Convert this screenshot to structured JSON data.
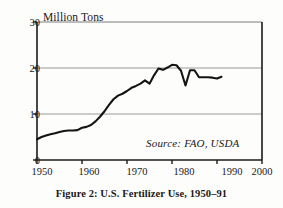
{
  "figure": {
    "caption": "Figure 2: U.S. Fertilizer Use, 1950–91",
    "source_note": "Source: FAO, USDA",
    "axis_title": "Million Tons",
    "line_color": "#141414",
    "grid_color": "#9a9a9a",
    "axis_color": "#1a1a1a",
    "background": "#fdfdfb"
  },
  "ticks": {
    "y": [
      "0",
      "10",
      "20",
      "30"
    ],
    "x": [
      "1950",
      "1960",
      "1970",
      "1980",
      "1990",
      "2000"
    ]
  },
  "chart_data": {
    "type": "line",
    "title": "Figure 2: U.S. Fertilizer Use, 1950–91",
    "xlabel": "",
    "ylabel": "Million Tons",
    "xlim": [
      1950,
      2000
    ],
    "ylim": [
      0,
      30
    ],
    "xticks": [
      1950,
      1960,
      1970,
      1980,
      1990,
      2000
    ],
    "yticks": [
      0,
      10,
      20,
      30
    ],
    "grid": "horizontal",
    "legend": "none",
    "annotations": [
      "Source: FAO, USDA"
    ],
    "series": [
      {
        "name": "U.S. Fertilizer Use",
        "x": [
          1950,
          1951,
          1952,
          1953,
          1954,
          1955,
          1956,
          1957,
          1958,
          1959,
          1960,
          1961,
          1962,
          1963,
          1964,
          1965,
          1966,
          1967,
          1968,
          1969,
          1970,
          1971,
          1972,
          1973,
          1974,
          1975,
          1976,
          1977,
          1978,
          1979,
          1980,
          1981,
          1982,
          1983,
          1984,
          1985,
          1986,
          1987,
          1988,
          1989,
          1990,
          1991
        ],
        "values": [
          4.5,
          5.0,
          5.3,
          5.6,
          5.8,
          6.1,
          6.3,
          6.4,
          6.4,
          6.5,
          7.0,
          7.2,
          7.6,
          8.4,
          9.4,
          10.6,
          12.0,
          13.2,
          14.0,
          14.4,
          15.0,
          15.7,
          16.1,
          16.6,
          17.3,
          16.6,
          18.4,
          19.9,
          19.6,
          20.1,
          20.7,
          20.6,
          19.4,
          16.2,
          19.5,
          19.5,
          18.0,
          18.0,
          18.0,
          17.9,
          17.7,
          18.1
        ],
        "units": "million tons"
      }
    ]
  }
}
